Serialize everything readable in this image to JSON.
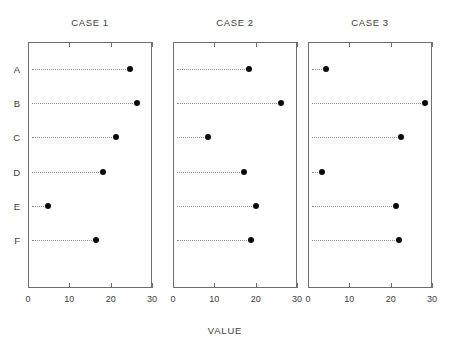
{
  "chart_data": {
    "type": "scatter",
    "plot_style": "dot-plot",
    "title": "",
    "xlabel": "VALUE",
    "ylabel": "",
    "categories": [
      "A",
      "B",
      "C",
      "D",
      "E",
      "F"
    ],
    "xticks": [
      0,
      10,
      20,
      30
    ],
    "xlim": [
      0,
      30
    ],
    "grid": false,
    "leader_lines": true,
    "legend": "none",
    "panels": [
      {
        "title": "CASE 1",
        "values": [
          24.7,
          26.4,
          21.4,
          18.2,
          4.8,
          16.5
        ]
      },
      {
        "title": "CASE 2",
        "values": [
          18.4,
          26.1,
          8.4,
          17.1,
          20.0,
          18.9
        ]
      },
      {
        "title": "CASE 3",
        "values": [
          4.4,
          28.2,
          22.4,
          3.5,
          21.2,
          22.0
        ]
      }
    ],
    "marker_color": "#0b0b0b",
    "axis_color": "#6e6e6e",
    "leader_color": "#8c8c8c"
  },
  "layout": {
    "panel_top": 42,
    "panel_bottom": 288,
    "panel_width": 124,
    "panel_lefts": [
      28,
      173,
      308
    ],
    "row_y": [
      69,
      103,
      137,
      172,
      206,
      240
    ],
    "title_y": 17,
    "tick_label_y": 294,
    "axis_title_y": 325,
    "axis_title_x": 225
  }
}
